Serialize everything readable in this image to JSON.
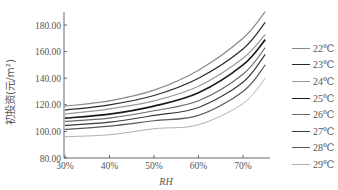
{
  "chart_data": {
    "type": "line",
    "title": "",
    "xlabel": "RH",
    "ylabel": "初投资(元/m²)",
    "x": [
      30,
      40,
      50,
      60,
      70,
      75
    ],
    "x_tick_labels": [
      "30%",
      "40%",
      "50%",
      "60%",
      "70%"
    ],
    "y_tick_labels": [
      "80.00",
      "100.00",
      "120.00",
      "140.00",
      "160.00",
      "180.00"
    ],
    "xlim": [
      30,
      76
    ],
    "ylim": [
      80,
      190
    ],
    "grid": false,
    "legend_position": "right",
    "series": [
      {
        "name": "22℃",
        "color": "#8a8a8a",
        "width": 1.2,
        "values": [
          119,
          123,
          131,
          146,
          170,
          190
        ]
      },
      {
        "name": "23℃",
        "color": "#2a2a2a",
        "width": 1.2,
        "values": [
          116,
          120,
          127,
          140,
          162,
          182
        ]
      },
      {
        "name": "24℃",
        "color": "#9a9a9a",
        "width": 1.2,
        "values": [
          113,
          117,
          123,
          134,
          155,
          173
        ]
      },
      {
        "name": "25℃",
        "color": "#1a1a1a",
        "width": 1.6,
        "values": [
          110,
          113,
          119,
          129,
          150,
          169
        ]
      },
      {
        "name": "26℃",
        "color": "#6a6a6a",
        "width": 1.2,
        "values": [
          107.5,
          110,
          115.5,
          123,
          143,
          163
        ]
      },
      {
        "name": "27℃",
        "color": "#3a3a3a",
        "width": 1.2,
        "values": [
          104.5,
          107,
          112,
          118,
          137,
          158
        ]
      },
      {
        "name": "28℃",
        "color": "#5a5a5a",
        "width": 1.2,
        "values": [
          101.5,
          104,
          108,
          112,
          130,
          150
        ]
      },
      {
        "name": "29℃",
        "color": "#b0b0b0",
        "width": 1.0,
        "values": [
          96,
          97.5,
          102,
          105,
          121,
          140
        ]
      }
    ]
  },
  "legend": {
    "items": [
      "22℃",
      "23℃",
      "24℃",
      "25℃",
      "26℃",
      "27℃",
      "28℃",
      "29℃"
    ]
  }
}
